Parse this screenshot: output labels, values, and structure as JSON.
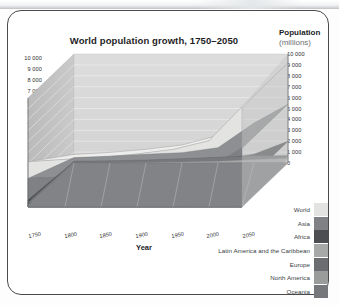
{
  "card": {
    "title": "World population growth, 1750–2050",
    "y_axis_header": "Population",
    "y_axis_subheader": "(millions)",
    "x_axis_title": "Year"
  },
  "axis": {
    "y_ticks": [
      "10 000",
      "9 000",
      "8 000",
      "7 000",
      "6 000",
      "5 000",
      "4 000",
      "3 000",
      "2 000",
      "1 000",
      "0"
    ],
    "y_ticks_right": [
      "10 000",
      "9 000",
      "8 000",
      "7 000",
      "6 000",
      "5 000",
      "4 000",
      "3 000",
      "2 000",
      "1 000",
      "0"
    ],
    "x_ticks": [
      "1750",
      "1800",
      "1850",
      "1900",
      "1950",
      "2000",
      "2050"
    ]
  },
  "legend": {
    "items": [
      {
        "label": "World",
        "color": "#e3e4e2"
      },
      {
        "label": "Asia",
        "color": "#7f8184"
      },
      {
        "label": "Africa",
        "color": "#4c4e51"
      },
      {
        "label": "Latin America and the Caribbean",
        "color": "#a7a9a8"
      },
      {
        "label": "Europe",
        "color": "#6b6d70"
      },
      {
        "label": "North America",
        "color": "#9a9c9b"
      },
      {
        "label": "Oceania",
        "color": "#75777a"
      }
    ]
  },
  "chart_data": {
    "type": "area",
    "title": "World population growth, 1750–2050",
    "xlabel": "Year",
    "ylabel": "Population (millions)",
    "ylim": [
      0,
      10000
    ],
    "grid": true,
    "legend_position": "bottom-right",
    "x": [
      1750,
      1800,
      1850,
      1900,
      1950,
      2000,
      2050
    ],
    "series": [
      {
        "name": "World",
        "color": "#e3e4e2",
        "values": [
          791,
          978,
          1262,
          1650,
          2519,
          6070,
          9191
        ]
      },
      {
        "name": "Asia",
        "color": "#7f8184",
        "values": [
          502,
          635,
          809,
          947,
          1402,
          3676,
          5217
        ]
      },
      {
        "name": "Africa",
        "color": "#4c4e51",
        "values": [
          106,
          107,
          111,
          133,
          221,
          796,
          1937
        ]
      },
      {
        "name": "Latin America and the Caribbean",
        "color": "#a7a9a8",
        "values": [
          16,
          24,
          38,
          74,
          167,
          521,
          769
        ]
      },
      {
        "name": "Europe",
        "color": "#6b6d70",
        "values": [
          163,
          203,
          276,
          408,
          547,
          727,
          653
        ]
      },
      {
        "name": "North America",
        "color": "#9a9c9b",
        "values": [
          2,
          7,
          26,
          82,
          172,
          314,
          438
        ]
      },
      {
        "name": "Oceania",
        "color": "#75777a",
        "values": [
          2,
          2,
          2,
          6,
          13,
          31,
          46
        ]
      }
    ]
  }
}
